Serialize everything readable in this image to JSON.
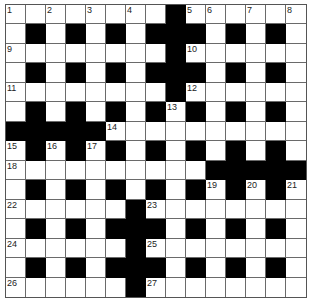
{
  "puzzle": {
    "rows": 15,
    "cols": 15,
    "colors": {
      "block": "#000000",
      "cell": "#ffffff",
      "line": "#6a6a6a"
    },
    "grid": [
      "WWWWWWWWBWWWWWW",
      "WBWBWBWBBBWBWBW",
      "WWWWWWWWBWWWWWW",
      "WBWBWBWBBBWBWBW",
      "WWWWWWWWBWWWWWW",
      "WBWBWBWBWBWBWBW",
      "BBBBBWWWWWWWWWW",
      "WBWBWBWBWBWBWBW",
      "WWWWWWWWWWBBBBB",
      "WBWBWBWBWBWBWBW",
      "WWWWWWBWWWWWWWW",
      "WBWBWBBBWBWBWBW",
      "WWWWWWBWWWWWWWW",
      "WBWBWBBBWBWBWBW",
      "WWWWWWBWWWWWWWW"
    ],
    "numbers": [
      {
        "n": "1",
        "r": 0,
        "c": 0
      },
      {
        "n": "2",
        "r": 0,
        "c": 2
      },
      {
        "n": "3",
        "r": 0,
        "c": 4
      },
      {
        "n": "4",
        "r": 0,
        "c": 6
      },
      {
        "n": "5",
        "r": 0,
        "c": 9
      },
      {
        "n": "6",
        "r": 0,
        "c": 10
      },
      {
        "n": "7",
        "r": 0,
        "c": 12
      },
      {
        "n": "8",
        "r": 0,
        "c": 14
      },
      {
        "n": "9",
        "r": 2,
        "c": 0
      },
      {
        "n": "10",
        "r": 2,
        "c": 9
      },
      {
        "n": "11",
        "r": 4,
        "c": 0
      },
      {
        "n": "12",
        "r": 4,
        "c": 9
      },
      {
        "n": "13",
        "r": 5,
        "c": 8
      },
      {
        "n": "14",
        "r": 6,
        "c": 5
      },
      {
        "n": "15",
        "r": 7,
        "c": 0
      },
      {
        "n": "16",
        "r": 7,
        "c": 2
      },
      {
        "n": "17",
        "r": 7,
        "c": 4
      },
      {
        "n": "18",
        "r": 8,
        "c": 0
      },
      {
        "n": "19",
        "r": 9,
        "c": 10
      },
      {
        "n": "20",
        "r": 9,
        "c": 12
      },
      {
        "n": "21",
        "r": 9,
        "c": 14
      },
      {
        "n": "22",
        "r": 10,
        "c": 0
      },
      {
        "n": "23",
        "r": 10,
        "c": 7
      },
      {
        "n": "24",
        "r": 12,
        "c": 0
      },
      {
        "n": "25",
        "r": 12,
        "c": 7
      },
      {
        "n": "26",
        "r": 14,
        "c": 0
      },
      {
        "n": "27",
        "r": 14,
        "c": 7
      }
    ]
  }
}
